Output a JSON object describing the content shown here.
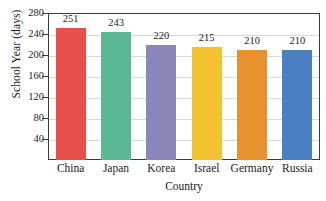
{
  "chart_data": {
    "type": "bar",
    "title": "",
    "xlabel": "Country",
    "ylabel": "School Year (days)",
    "categories": [
      "China",
      "Japan",
      "Korea",
      "Israel",
      "Germany",
      "Russia"
    ],
    "values": [
      251,
      243,
      220,
      215,
      210,
      210
    ],
    "data_labels": [
      "251",
      "243",
      "220",
      "215",
      "210",
      "210"
    ],
    "bar_colors": [
      "#E8514B",
      "#5CB894",
      "#8B85B8",
      "#F2C230",
      "#E8922F",
      "#4A7FC1"
    ],
    "ylim": [
      0,
      280
    ],
    "ytick_values": [
      40,
      80,
      120,
      160,
      200,
      240,
      280
    ],
    "ytick_labels": [
      "40",
      "80",
      "120",
      "160",
      "200",
      "240",
      "280"
    ],
    "grid": true,
    "legend": "none",
    "axis_color": "#3a3a3a",
    "grid_color": "#d8d8d8",
    "background": "#ffffff"
  }
}
